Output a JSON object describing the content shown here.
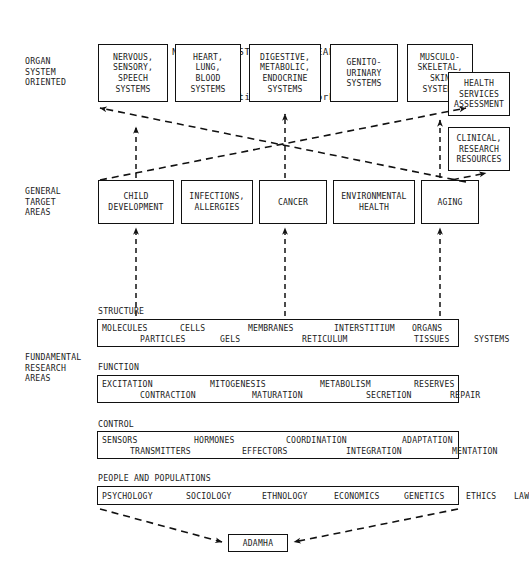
{
  "title": {
    "line1": "NATIONAL INSTITUTES OF HEALTH:",
    "line2": "A Three-tiered Framework"
  },
  "tiers": [
    {
      "label": "ORGAN\nSYSTEM\nORIENTED"
    },
    {
      "label": "GENERAL\nTARGET\nAREAS"
    },
    {
      "label": "FUNDAMENTAL\nRESEARCH\nAREAS"
    }
  ],
  "organ_systems": [
    {
      "label": "NERVOUS,\nSENSORY,\nSPEECH\nSYSTEMS"
    },
    {
      "label": "HEART,\nLUNG,\nBLOOD\nSYSTEMS"
    },
    {
      "label": "DIGESTIVE,\nMETABOLIC,\nENDOCRINE\nSYSTEMS"
    },
    {
      "label": "GENITO-\nURINARY\nSYSTEMS"
    },
    {
      "label": "MUSCULO-\nSKELETAL,\nSKIN\nSYSTEMS"
    }
  ],
  "side_boxes": [
    {
      "label": "HEALTH\nSERVICES\nASSESSMENT"
    },
    {
      "label": "CLINICAL,\nRESEARCH\nRESOURCES"
    }
  ],
  "target_areas": [
    {
      "label": "CHILD\nDEVELOPMENT"
    },
    {
      "label": "INFECTIONS,\nALLERGIES"
    },
    {
      "label": "CANCER"
    },
    {
      "label": "ENVIRONMENTAL\nHEALTH"
    },
    {
      "label": "AGING"
    }
  ],
  "fundamental_blocks": [
    {
      "heading": "STRUCTURE",
      "row1": [
        "MOLECULES",
        "CELLS",
        "MEMBRANES",
        "INTERSTITIUM",
        "ORGANS"
      ],
      "row2": [
        "PARTICLES",
        "GELS",
        "RETICULUM",
        "TISSUES",
        "SYSTEMS"
      ]
    },
    {
      "heading": "FUNCTION",
      "row1": [
        "EXCITATION",
        "MITOGENESIS",
        "METABOLISM",
        "RESERVES"
      ],
      "row2": [
        "CONTRACTION",
        "MATURATION",
        "SECRETION",
        "REPAIR"
      ]
    },
    {
      "heading": "CONTROL",
      "row1": [
        "SENSORS",
        "HORMONES",
        "COORDINATION",
        "ADAPTATION"
      ],
      "row2": [
        "TRANSMITTERS",
        "EFFECTORS",
        "INTEGRATION",
        "MENTATION"
      ]
    },
    {
      "heading": "PEOPLE AND POPULATIONS",
      "row1": [
        "PSYCHOLOGY",
        "SOCIOLOGY",
        "ETHNOLOGY",
        "ECONOMICS",
        "GENETICS",
        "ETHICS",
        "LAW"
      ],
      "row2": []
    }
  ],
  "bottom_box": {
    "label": "ADAMHA"
  },
  "colors": {
    "ink": "#111111",
    "background": "#ffffff"
  }
}
